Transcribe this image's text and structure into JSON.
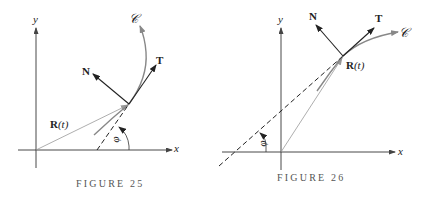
{
  "figures": [
    {
      "caption": "FIGURE 25",
      "labels": {
        "x_axis": "x",
        "y_axis": "y",
        "curve": "𝒞",
        "tangent": "T",
        "normal": "N",
        "position_vector": "R(t)",
        "position_vector_bold": "R",
        "position_vector_arg": "(t)",
        "angle": "φ"
      }
    },
    {
      "caption": "FIGURE 26",
      "labels": {
        "x_axis": "x",
        "y_axis": "y",
        "curve": "𝒞",
        "tangent": "T",
        "normal": "N",
        "position_vector": "R(t)",
        "position_vector_bold": "R",
        "position_vector_arg": "(t)",
        "angle": "φ"
      }
    }
  ],
  "colors": {
    "axis": "#333333",
    "curve": "#888888",
    "vector": "#222222",
    "position_vector": "#999999",
    "caption": "#555555"
  }
}
